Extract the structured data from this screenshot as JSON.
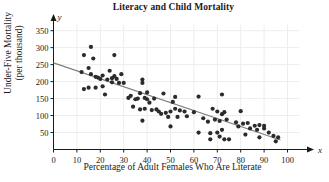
{
  "chart_data": {
    "type": "scatter",
    "title": "Literacy and Child Mortality",
    "xlabel": "Percentage of Adult Females Who Are Literate",
    "ylabel_line1": "Under-Five Mortality",
    "ylabel_line2": "(per thousand)",
    "x_axis_variable": "x",
    "y_axis_variable": "y",
    "xlim": [
      0,
      105
    ],
    "ylim": [
      0,
      380
    ],
    "xticks": [
      0,
      10,
      20,
      30,
      40,
      50,
      60,
      70,
      80,
      90,
      100
    ],
    "yticks": [
      50,
      100,
      150,
      200,
      250,
      300,
      350
    ],
    "grid": true,
    "legend": "none",
    "point_color": "#2b2b2b",
    "line_color": "#808080",
    "grid_color": "#ededed",
    "axis_color": "#1a1a1a",
    "trend_line": {
      "label": "least-squares regression line",
      "x_start": 0,
      "y_start": 255,
      "x_end": 97,
      "y_end": 28
    },
    "points": [
      [
        12,
        228
      ],
      [
        13,
        278
      ],
      [
        13,
        178
      ],
      [
        15,
        182
      ],
      [
        15,
        240
      ],
      [
        16,
        302
      ],
      [
        16,
        222
      ],
      [
        17,
        268
      ],
      [
        18,
        214
      ],
      [
        18,
        182
      ],
      [
        19,
        212
      ],
      [
        20,
        208
      ],
      [
        21,
        218
      ],
      [
        21,
        186
      ],
      [
        22,
        162
      ],
      [
        23,
        206
      ],
      [
        24,
        232
      ],
      [
        25,
        210
      ],
      [
        25,
        198
      ],
      [
        26,
        278
      ],
      [
        26,
        216
      ],
      [
        27,
        208
      ],
      [
        28,
        196
      ],
      [
        29,
        222
      ],
      [
        30,
        196
      ],
      [
        32,
        152
      ],
      [
        33,
        158
      ],
      [
        34,
        126
      ],
      [
        35,
        148
      ],
      [
        36,
        150
      ],
      [
        37,
        118
      ],
      [
        37,
        166
      ],
      [
        38,
        85
      ],
      [
        38,
        206
      ],
      [
        38,
        196
      ],
      [
        39,
        120
      ],
      [
        39,
        152
      ],
      [
        40,
        168
      ],
      [
        40,
        148
      ],
      [
        41,
        138
      ],
      [
        42,
        116
      ],
      [
        43,
        150
      ],
      [
        44,
        118
      ],
      [
        45,
        112
      ],
      [
        46,
        105
      ],
      [
        47,
        165
      ],
      [
        48,
        108
      ],
      [
        49,
        96
      ],
      [
        50,
        112
      ],
      [
        50,
        68
      ],
      [
        51,
        140
      ],
      [
        52,
        155
      ],
      [
        52,
        120
      ],
      [
        53,
        96
      ],
      [
        54,
        115
      ],
      [
        56,
        112
      ],
      [
        57,
        98
      ],
      [
        60,
        110
      ],
      [
        62,
        156
      ],
      [
        62,
        50
      ],
      [
        64,
        92
      ],
      [
        66,
        82
      ],
      [
        67,
        30
      ],
      [
        67,
        48
      ],
      [
        68,
        120
      ],
      [
        69,
        88
      ],
      [
        70,
        112
      ],
      [
        70,
        50
      ],
      [
        71,
        84
      ],
      [
        71,
        38
      ],
      [
        72,
        104
      ],
      [
        72,
        162
      ],
      [
        72,
        58
      ],
      [
        73,
        110
      ],
      [
        73,
        30
      ],
      [
        74,
        88
      ],
      [
        75,
        30
      ],
      [
        78,
        80
      ],
      [
        79,
        68
      ],
      [
        80,
        113
      ],
      [
        81,
        76
      ],
      [
        82,
        44
      ],
      [
        83,
        78
      ],
      [
        84,
        62
      ],
      [
        86,
        70
      ],
      [
        87,
        58
      ],
      [
        88,
        72
      ],
      [
        88,
        36
      ],
      [
        90,
        62
      ],
      [
        90,
        70
      ],
      [
        92,
        50
      ],
      [
        94,
        40
      ],
      [
        95,
        24
      ],
      [
        96,
        36
      ]
    ]
  }
}
